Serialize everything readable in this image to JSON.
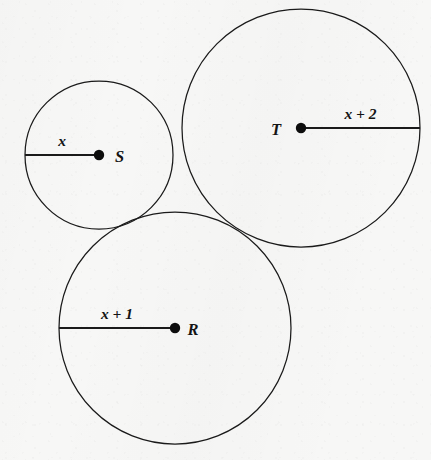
{
  "figure": {
    "width": 431,
    "height": 460,
    "background_color": "#f7f7f6",
    "stroke_color": "#1a1a1a"
  },
  "chart_data": {
    "type": "diagram",
    "subtype": "geometry-circles",
    "units": "pixels",
    "circles": [
      {
        "id": "S",
        "point_label": "S",
        "radius_label": "x",
        "center": [
          99,
          155
        ],
        "radius": 74,
        "radius_line_from": [
          25,
          155
        ],
        "radius_line_to": [
          99,
          155
        ],
        "radius_label_position": [
          66,
          146
        ],
        "point_label_position": [
          115,
          162
        ]
      },
      {
        "id": "T",
        "point_label": "T",
        "radius_label": "x + 2",
        "center": [
          301,
          128
        ],
        "radius": 119,
        "radius_line_from": [
          301,
          128
        ],
        "radius_line_to": [
          420,
          128
        ],
        "radius_label_position": [
          340,
          119
        ],
        "point_label_position": [
          276,
          135
        ]
      },
      {
        "id": "R",
        "point_label": "R",
        "radius_label": "x + 1",
        "center": [
          175,
          328
        ],
        "radius": 116,
        "radius_line_from": [
          59,
          328
        ],
        "radius_line_to": [
          175,
          328
        ],
        "radius_label_position": [
          95,
          319
        ],
        "point_label_position": [
          193,
          335
        ]
      }
    ],
    "tangencies": [
      {
        "between": [
          "S",
          "T"
        ],
        "approx_point": [
          175,
          141
        ]
      },
      {
        "between": [
          "S",
          "R"
        ],
        "approx_point": [
          146,
          213
        ]
      },
      {
        "between": [
          "T",
          "R"
        ],
        "approx_point": [
          242,
          229
        ]
      }
    ]
  }
}
